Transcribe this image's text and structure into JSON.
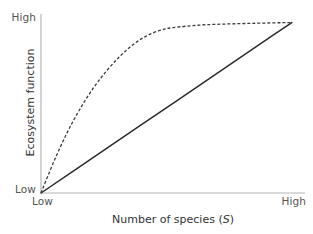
{
  "chart_data": {
    "type": "line",
    "title": "",
    "xlabel": "Number of species (S)",
    "xlabel_plain": "Number of species (",
    "xlabel_variable": "S",
    "xlabel_suffix": ")",
    "ylabel": "Ecosystem function",
    "xlim": [
      0,
      1
    ],
    "ylim": [
      0,
      1
    ],
    "xticks": [
      0,
      1
    ],
    "xticklabels": [
      "Low",
      "High"
    ],
    "yticks": [
      0,
      1
    ],
    "yticklabels": [
      "Low",
      "High"
    ],
    "grid": false,
    "legend": false,
    "legend_position": "none",
    "series": [
      {
        "name": "linear relationship",
        "style": "solid",
        "color": "#2b2b2b",
        "linewidth": 1.4,
        "x": [
          0.0,
          0.125,
          0.25,
          0.375,
          0.5,
          0.625,
          0.75,
          0.875,
          0.95
        ],
        "y": [
          0.0,
          0.1253,
          0.2507,
          0.376,
          0.5013,
          0.6267,
          0.752,
          0.8773,
          0.9524
        ]
      },
      {
        "name": "saturating relationship",
        "style": "dashed",
        "color": "#3c3c3c",
        "linewidth": 1.2,
        "dash_pattern": "3 2",
        "x": [
          0.0,
          0.05,
          0.1,
          0.15,
          0.2,
          0.25,
          0.3,
          0.35,
          0.4,
          0.45,
          0.5,
          0.6,
          0.7,
          0.8,
          0.9,
          0.95
        ],
        "y": [
          0.0,
          0.18,
          0.34,
          0.475,
          0.59,
          0.685,
          0.765,
          0.83,
          0.878,
          0.908,
          0.924,
          0.938,
          0.944,
          0.948,
          0.951,
          0.9524
        ]
      }
    ],
    "annotations": [],
    "axes_color": "#b5b5b5"
  },
  "axis_labels": {
    "y_high": "High",
    "y_low": "Low",
    "x_low": "Low",
    "x_high": "High"
  },
  "colors": {
    "background": "#ffffff",
    "axis": "#b5b5b5",
    "solid_line": "#2b2b2b",
    "dashed_line": "#3c3c3c",
    "tick_text": "#555555",
    "title_text": "#333333"
  }
}
